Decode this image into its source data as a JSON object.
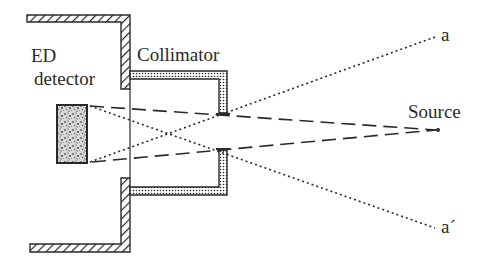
{
  "figure": {
    "type": "schematic",
    "labels": {
      "detector_line1": "ED",
      "detector_line2": "detector",
      "collimator": "Collimator",
      "source": "Source",
      "ray_a": "a",
      "ray_a_prime": "a´"
    },
    "colors": {
      "ink": "#2a2a2a",
      "background": "#ffffff"
    },
    "line_styles": {
      "collimated_beam": "long-dash",
      "acceptance_limits": "dotted"
    }
  }
}
